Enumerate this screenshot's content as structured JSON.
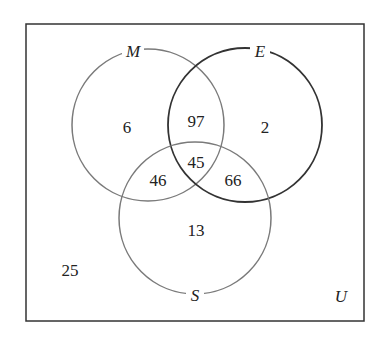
{
  "universe_label": "U",
  "sets": [
    {
      "label": "M",
      "color": "#7a7a7a"
    },
    {
      "label": "E",
      "color": "#333333"
    },
    {
      "label": "S",
      "color": "#7a7a7a"
    }
  ],
  "regions": {
    "M_only": "6",
    "E_only": "2",
    "S_only": "13",
    "M_and_E_only": "97",
    "M_and_S_only": "46",
    "E_and_S_only": "66",
    "M_E_S": "45",
    "outside": "25"
  }
}
